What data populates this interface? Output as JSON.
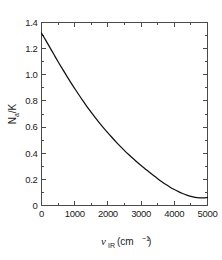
{
  "figure": {
    "background_color": "#ffffff",
    "frame_color": "#4a4a4a",
    "curve_color": "#111111"
  },
  "chart_data": {
    "type": "line",
    "title": "",
    "subtitle": "",
    "xlabel": "nu_IR (cm^-1)",
    "ylabel": "Na/K",
    "xlabel_parts": {
      "symbol": "ν",
      "subscript": "IR",
      "units_open": " (cm",
      "units_exponent": "−1",
      "units_close": ")"
    },
    "ylabel_parts": {
      "symbol": "N",
      "subscript": "a",
      "divider": "/",
      "denominator": "K"
    },
    "xlim": [
      0,
      5000
    ],
    "ylim": [
      0,
      1.4
    ],
    "grid": false,
    "legend": null,
    "legend_position": "none",
    "x_major_ticks": [
      0,
      1000,
      2000,
      3000,
      4000,
      5000
    ],
    "x_tick_labels": [
      "0",
      "1000",
      "2000",
      "3000",
      "4000",
      "5000"
    ],
    "x_minor_ticks": [
      500,
      1500,
      2500,
      3500,
      4500
    ],
    "y_major_ticks": [
      0,
      0.2,
      0.4,
      0.6,
      0.8,
      1.0,
      1.2,
      1.4
    ],
    "y_tick_labels": [
      "0",
      "0.2",
      "0.4",
      "0.6",
      "0.8",
      "1.0",
      "1.2",
      "1.4"
    ],
    "y_minor_ticks": [
      0.1,
      0.3,
      0.5,
      0.7,
      0.9,
      1.1,
      1.3
    ],
    "tick_direction": "in",
    "frame_sides": [
      "left",
      "bottom",
      "top",
      "right"
    ],
    "series": [
      {
        "name": "Na/K",
        "x": [
          0,
          125,
          250,
          375,
          500,
          625,
          750,
          875,
          1000,
          1125,
          1250,
          1375,
          1500,
          1625,
          1750,
          1875,
          2000,
          2125,
          2250,
          2375,
          2500,
          2625,
          2750,
          2875,
          3000,
          3125,
          3250,
          3375,
          3500,
          3625,
          3750,
          3875,
          4000,
          4125,
          4250,
          4375,
          4500,
          4625,
          4750,
          4875,
          5000
        ],
        "y": [
          1.32,
          1.265,
          1.21,
          1.155,
          1.1,
          1.047,
          0.995,
          0.944,
          0.895,
          0.847,
          0.8,
          0.755,
          0.712,
          0.67,
          0.63,
          0.592,
          0.556,
          0.52,
          0.485,
          0.452,
          0.42,
          0.39,
          0.361,
          0.333,
          0.306,
          0.28,
          0.254,
          0.229,
          0.205,
          0.182,
          0.16,
          0.14,
          0.122,
          0.106,
          0.092,
          0.08,
          0.07,
          0.063,
          0.059,
          0.058,
          0.062
        ]
      }
    ]
  }
}
